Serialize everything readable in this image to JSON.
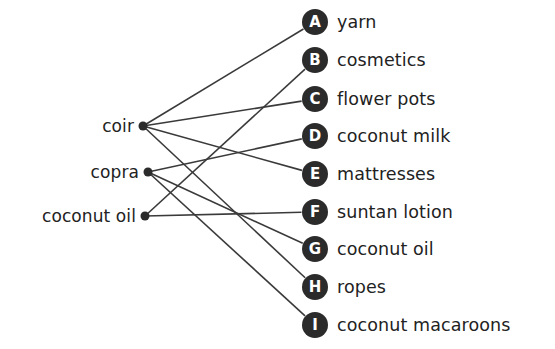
{
  "diagram": {
    "type": "bipartite-mapping",
    "title": "",
    "background_color": "#ffffff",
    "line_color": "#3a3a3a",
    "node_color": "#2b2b2b",
    "text_color": "#222222",
    "sources": [
      {
        "id": "coir",
        "label": "coir",
        "x": 143,
        "y": 126
      },
      {
        "id": "copra",
        "label": "copra",
        "x": 148,
        "y": 172
      },
      {
        "id": "coconut_oil",
        "label": "coconut oil",
        "x": 145,
        "y": 216
      }
    ],
    "targets": [
      {
        "id": "A",
        "badge": "A",
        "label": "yarn",
        "x": 315,
        "y": 22
      },
      {
        "id": "B",
        "badge": "B",
        "label": "cosmetics",
        "x": 315,
        "y": 60
      },
      {
        "id": "C",
        "badge": "C",
        "label": "flower pots",
        "x": 315,
        "y": 99
      },
      {
        "id": "D",
        "badge": "D",
        "label": "coconut milk",
        "x": 315,
        "y": 136
      },
      {
        "id": "E",
        "badge": "E",
        "label": "mattresses",
        "x": 315,
        "y": 174
      },
      {
        "id": "F",
        "badge": "F",
        "label": "suntan lotion",
        "x": 315,
        "y": 212
      },
      {
        "id": "G",
        "badge": "G",
        "label": "coconut oil",
        "x": 315,
        "y": 249
      },
      {
        "id": "H",
        "badge": "H",
        "label": "ropes",
        "x": 315,
        "y": 287
      },
      {
        "id": "I",
        "badge": "I",
        "label": "coconut macaroons",
        "x": 315,
        "y": 325
      }
    ],
    "edges": [
      {
        "from": "coir",
        "to": "A"
      },
      {
        "from": "coir",
        "to": "C"
      },
      {
        "from": "coir",
        "to": "E"
      },
      {
        "from": "coir",
        "to": "H"
      },
      {
        "from": "copra",
        "to": "D"
      },
      {
        "from": "copra",
        "to": "G"
      },
      {
        "from": "copra",
        "to": "I"
      },
      {
        "from": "coconut_oil",
        "to": "B"
      },
      {
        "from": "coconut_oil",
        "to": "F"
      }
    ]
  }
}
